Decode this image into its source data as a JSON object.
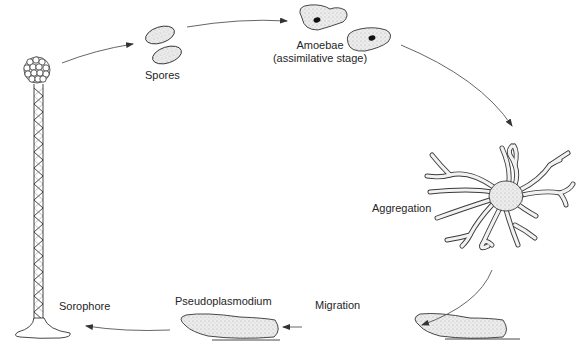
{
  "diagram": {
    "title": "",
    "type": "life-cycle",
    "colors": {
      "ink": "#3a3a3a",
      "fill": "#e6e6e6",
      "nucleus": "#111111",
      "background": "#ffffff"
    },
    "stages": [
      {
        "id": "spores",
        "label": "Spores"
      },
      {
        "id": "amoebae",
        "label": "Amoebae",
        "sublabel": "(assimilative stage)"
      },
      {
        "id": "aggregation",
        "label": "Aggregation"
      },
      {
        "id": "migration",
        "label": "Migration"
      },
      {
        "id": "pseudoplasmodium",
        "label": "Pseudoplasmodium"
      },
      {
        "id": "sorophore",
        "label": "Sorophore"
      }
    ],
    "arrows": [
      {
        "from": "sorophore",
        "to": "spores"
      },
      {
        "from": "spores",
        "to": "amoebae"
      },
      {
        "from": "amoebae",
        "to": "aggregation"
      },
      {
        "from": "aggregation",
        "to": "migration"
      },
      {
        "from": "migration",
        "to": "pseudoplasmodium"
      },
      {
        "from": "pseudoplasmodium",
        "to": "sorophore"
      }
    ]
  }
}
